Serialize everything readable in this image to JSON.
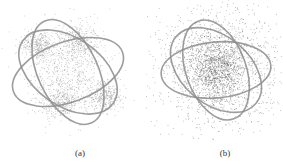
{
  "chart_data": [
    {
      "type": "scatter",
      "title": "",
      "caption": "(a)",
      "description": "Point cloud embedded in three crossing elliptical rings; points concentrated in four dense clusters plus sparse central fill",
      "xlabel": "",
      "ylabel": "",
      "grid": false,
      "legend": null,
      "rings": [
        {
          "cx": 68,
          "cy": 72,
          "rx": 58,
          "ry": 30,
          "rot": -20
        },
        {
          "cx": 68,
          "cy": 72,
          "rx": 55,
          "ry": 34,
          "rot": 35
        },
        {
          "cx": 68,
          "cy": 72,
          "rx": 30,
          "ry": 56,
          "rot": -25
        }
      ],
      "clusters": [
        {
          "cx": 38,
          "cy": 45,
          "sx": 9,
          "sy": 7,
          "n": 350
        },
        {
          "cx": 78,
          "cy": 40,
          "sx": 9,
          "sy": 8,
          "n": 350
        },
        {
          "cx": 60,
          "cy": 102,
          "sx": 11,
          "sy": 8,
          "n": 350
        },
        {
          "cx": 105,
          "cy": 97,
          "sx": 9,
          "sy": 7,
          "n": 350
        },
        {
          "cx": 68,
          "cy": 72,
          "sx": 20,
          "sy": 22,
          "n": 700
        }
      ],
      "point_color": "#8a8a8a",
      "ring_color": "#8c8c8c"
    },
    {
      "type": "scatter",
      "title": "",
      "caption": "(b)",
      "description": "Point cloud embedded in three crossing elliptical rings; points form a single diffuse dense core with wide scattered halo",
      "xlabel": "",
      "ylabel": "",
      "grid": false,
      "legend": null,
      "rings": [
        {
          "cx": 70,
          "cy": 70,
          "rx": 55,
          "ry": 28,
          "rot": -5
        },
        {
          "cx": 70,
          "cy": 70,
          "rx": 52,
          "ry": 34,
          "rot": 40
        },
        {
          "cx": 70,
          "cy": 70,
          "rx": 30,
          "ry": 52,
          "rot": -20
        }
      ],
      "clusters": [
        {
          "cx": 70,
          "cy": 68,
          "sx": 14,
          "sy": 16,
          "n": 1100
        },
        {
          "cx": 72,
          "cy": 68,
          "sx": 30,
          "sy": 32,
          "n": 1400
        }
      ],
      "point_color": "#5a5a5a",
      "ring_color": "#8c8c8c"
    }
  ],
  "captions": {
    "a": "(a)",
    "b": "(b)"
  }
}
